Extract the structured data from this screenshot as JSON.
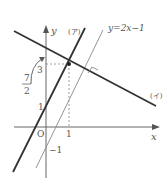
{
  "diagram": {
    "axes": {
      "x_label": "x",
      "y_label": "y",
      "origin_label": "O"
    },
    "ticks": {
      "x_one": "1",
      "y_one": "1",
      "y_three": "3",
      "y_minus_one": "−1"
    },
    "fraction": {
      "numerator": "7",
      "denominator": "2"
    },
    "lines": [
      {
        "id": "a",
        "label": "(ア)",
        "description": "thick line through (0,1) and (1,3), slope 2"
      },
      {
        "id": "b",
        "label": "y=2x−1",
        "description": "thin line through (0,−1) and (1,1)"
      },
      {
        "id": "c",
        "label": "(イ)",
        "description": "thick line through (1,3), perpendicular to y=2x−1, y-intercept 7/2"
      }
    ],
    "point": {
      "x": 1,
      "y": 3
    },
    "colors": {
      "axis": "#666666",
      "thick_line": "#333333",
      "thin_line": "#777777",
      "dashed": "#888888"
    }
  }
}
